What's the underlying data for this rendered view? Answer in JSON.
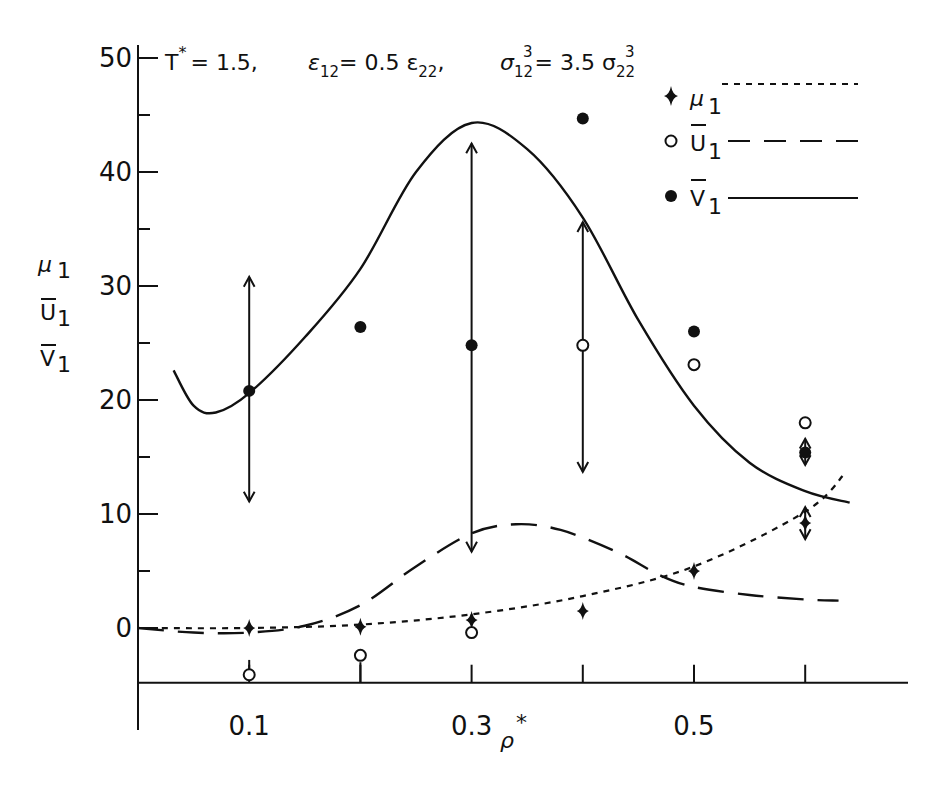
{
  "chart_data": {
    "type": "line",
    "title": "",
    "annotation": {
      "t_label": "T",
      "t_sup": "*",
      "t_value": "= 1.5,",
      "eps_label": "ε",
      "eps_sub": "12",
      "eps_value": "= 0.5 ε",
      "eps_sub2": "22",
      "eps_comma": ",",
      "sigma_label": "σ",
      "sigma_sub": "12",
      "sigma_sup": "3",
      "sigma_value": "= 3.5 σ",
      "sigma_sub2": "22",
      "sigma_sup2": "3"
    },
    "xlabel": "ρ",
    "xlabel_sup": "*",
    "ylabel_lines": [
      {
        "text": "μ",
        "sub": "1",
        "bar": false
      },
      {
        "text": "U",
        "sub": "1",
        "bar": true
      },
      {
        "text": "V",
        "sub": "1",
        "bar": true
      }
    ],
    "xlim": [
      0.0,
      0.69
    ],
    "ylim": [
      -4.8,
      51
    ],
    "x_ticks": [
      0.1,
      0.2,
      0.3,
      0.4,
      0.5,
      0.6
    ],
    "x_tick_labels": [
      {
        "value": 0.1,
        "label": "0.1"
      },
      {
        "value": 0.3,
        "label": "0.3"
      },
      {
        "value": 0.5,
        "label": "0.5"
      }
    ],
    "y_ticks": [
      0,
      5,
      10,
      15,
      20,
      25,
      30,
      35,
      40,
      45,
      50
    ],
    "y_tick_labels": [
      {
        "value": 0,
        "label": "0"
      },
      {
        "value": 10,
        "label": "10"
      },
      {
        "value": 20,
        "label": "20"
      },
      {
        "value": 30,
        "label": "30"
      },
      {
        "value": 40,
        "label": "40"
      },
      {
        "value": 50,
        "label": "50"
      }
    ],
    "grid": false,
    "legend_position": "upper right",
    "legend": [
      {
        "symbol": "filled-diamond",
        "label": "μ",
        "sub": "1",
        "bar": false,
        "line": "dotted"
      },
      {
        "symbol": "open-circle",
        "label": "U",
        "sub": "1",
        "bar": true,
        "line": "dashed"
      },
      {
        "symbol": "filled-circle",
        "label": "V",
        "sub": "1",
        "bar": true,
        "line": "solid"
      }
    ],
    "series": [
      {
        "name": "μ1 (theory)",
        "kind": "curve",
        "style": "dotted",
        "x": [
          0.0,
          0.1,
          0.2,
          0.3,
          0.4,
          0.5,
          0.6,
          0.636
        ],
        "y": [
          0.0,
          0.0,
          0.3,
          1.2,
          2.8,
          5.4,
          10.2,
          13.6
        ]
      },
      {
        "name": "U1 (theory)",
        "kind": "curve",
        "style": "dashed",
        "x": [
          0.0,
          0.05,
          0.1,
          0.15,
          0.2,
          0.25,
          0.3,
          0.34,
          0.38,
          0.43,
          0.47,
          0.5,
          0.55,
          0.6,
          0.63
        ],
        "y": [
          0.0,
          -0.4,
          -0.4,
          0.2,
          2.0,
          5.4,
          8.3,
          9.1,
          8.6,
          6.7,
          4.6,
          3.6,
          2.9,
          2.5,
          2.4
        ]
      },
      {
        "name": "V1 (theory)",
        "kind": "curve",
        "style": "solid",
        "x": [
          0.032,
          0.05,
          0.07,
          0.1,
          0.15,
          0.2,
          0.25,
          0.3,
          0.35,
          0.4,
          0.45,
          0.5,
          0.55,
          0.6,
          0.64
        ],
        "y": [
          22.6,
          19.5,
          18.9,
          20.6,
          25.5,
          31.5,
          40.0,
          44.3,
          42.0,
          36.0,
          27.0,
          19.5,
          14.5,
          12.0,
          11.0
        ]
      },
      {
        "name": "μ1 (simulation)",
        "kind": "points",
        "marker": "filled-diamond",
        "x": [
          0.1,
          0.2,
          0.3,
          0.4,
          0.5,
          0.6
        ],
        "y": [
          0.0,
          0.1,
          0.7,
          1.5,
          5.0,
          9.2
        ]
      },
      {
        "name": "U1 (simulation)",
        "kind": "points",
        "marker": "open-circle",
        "x": [
          0.1,
          0.2,
          0.3,
          0.4,
          0.5,
          0.6
        ],
        "y": [
          -4.1,
          -2.4,
          -0.4,
          24.8,
          23.1,
          18.0
        ]
      },
      {
        "name": "V1 (simulation)",
        "kind": "points",
        "marker": "filled-circle",
        "x": [
          0.1,
          0.2,
          0.3,
          0.4,
          0.5,
          0.6
        ],
        "y": [
          20.8,
          26.4,
          24.8,
          44.7,
          26.0,
          15.4
        ]
      }
    ],
    "error_bars": [
      {
        "x": 0.1,
        "y_low": 11.1,
        "y_high": 30.8
      },
      {
        "x": 0.3,
        "y_low": 6.7,
        "y_high": 42.5
      },
      {
        "x": 0.4,
        "y_low": 13.7,
        "y_high": 35.6
      },
      {
        "x": 0.6,
        "y_low": 14.3,
        "y_high": 16.6
      },
      {
        "x": 0.6,
        "y_low": 7.8,
        "y_high": 10.6
      }
    ],
    "small_stems": [
      {
        "x": 0.1,
        "y_low": -3.6,
        "y_high": -2.8
      },
      {
        "x": 0.2,
        "y_low": -4.8,
        "y_high": -3.0
      },
      {
        "x": 0.3,
        "y_low": 0.2,
        "y_high": 1.2
      }
    ]
  }
}
